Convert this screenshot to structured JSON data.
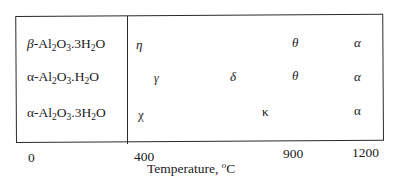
{
  "diagram": {
    "rows": [
      {
        "label_prefix": "β",
        "label_parts": [
          "-Al",
          "2",
          "O",
          "3",
          ".3H",
          "2",
          "O"
        ],
        "phases": [
          {
            "symbol": "η",
            "temp_x": 140
          },
          {
            "symbol": "θ",
            "temp_x": 297
          },
          {
            "symbol": "α",
            "temp_x": 356
          }
        ]
      },
      {
        "label_prefix": "α",
        "label_parts": [
          "-Al",
          "2",
          "O",
          "3",
          ".H",
          "2",
          "O"
        ],
        "phases": [
          {
            "symbol": "γ",
            "temp_x": 157
          },
          {
            "symbol": "δ",
            "temp_x": 233
          },
          {
            "symbol": "θ",
            "temp_x": 297
          },
          {
            "symbol": "α",
            "temp_x": 356
          }
        ]
      },
      {
        "label_prefix": "α",
        "label_parts": [
          "-Al",
          "2",
          "O",
          "3",
          ".3H",
          "2",
          "O"
        ],
        "phases": [
          {
            "symbol": "χ",
            "temp_x": 140
          },
          {
            "symbol": "κ",
            "temp_x": 262
          },
          {
            "symbol": "α",
            "temp_x": 356
          }
        ]
      }
    ],
    "x_axis": {
      "ticks": [
        "0",
        "400",
        "900",
        "1200"
      ],
      "title": "Temperature, ",
      "unit_sup": "o",
      "unit": "C"
    }
  }
}
